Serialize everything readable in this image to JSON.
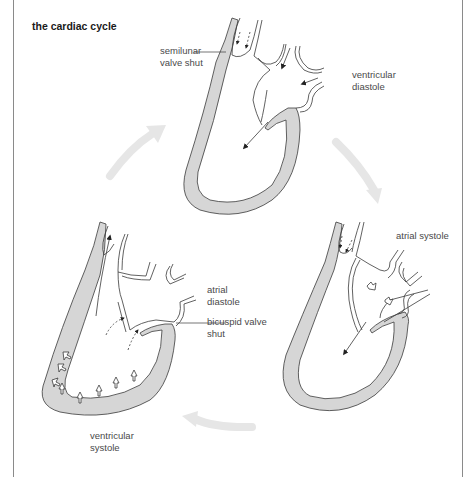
{
  "title": "the cardiac cycle",
  "labels": {
    "semilunar_line1": "semilunar",
    "semilunar_line2": "valve shut",
    "ventricular_diastole_line1": "ventricular",
    "ventricular_diastole_line2": "diastole",
    "atrial_systole": "atrial systole",
    "atrial_diastole_line1": "atrial",
    "atrial_diastole_line2": "diastole",
    "bicuspid_line1": "bicuspid valve",
    "bicuspid_line2": "shut",
    "ventricular_systole_line1": "ventricular",
    "ventricular_systole_line2": "systole"
  },
  "stages": [
    {
      "name": "ventricular diastole",
      "position": "top"
    },
    {
      "name": "atrial systole",
      "position": "bottom-right"
    },
    {
      "name": "ventricular systole",
      "position": "bottom-left"
    }
  ],
  "colors": {
    "wall_fill": "#d6d6d6",
    "outline": "#3a3a3a",
    "cycle_arrow": "#e6e6e6",
    "text": "#4a4a4a"
  }
}
